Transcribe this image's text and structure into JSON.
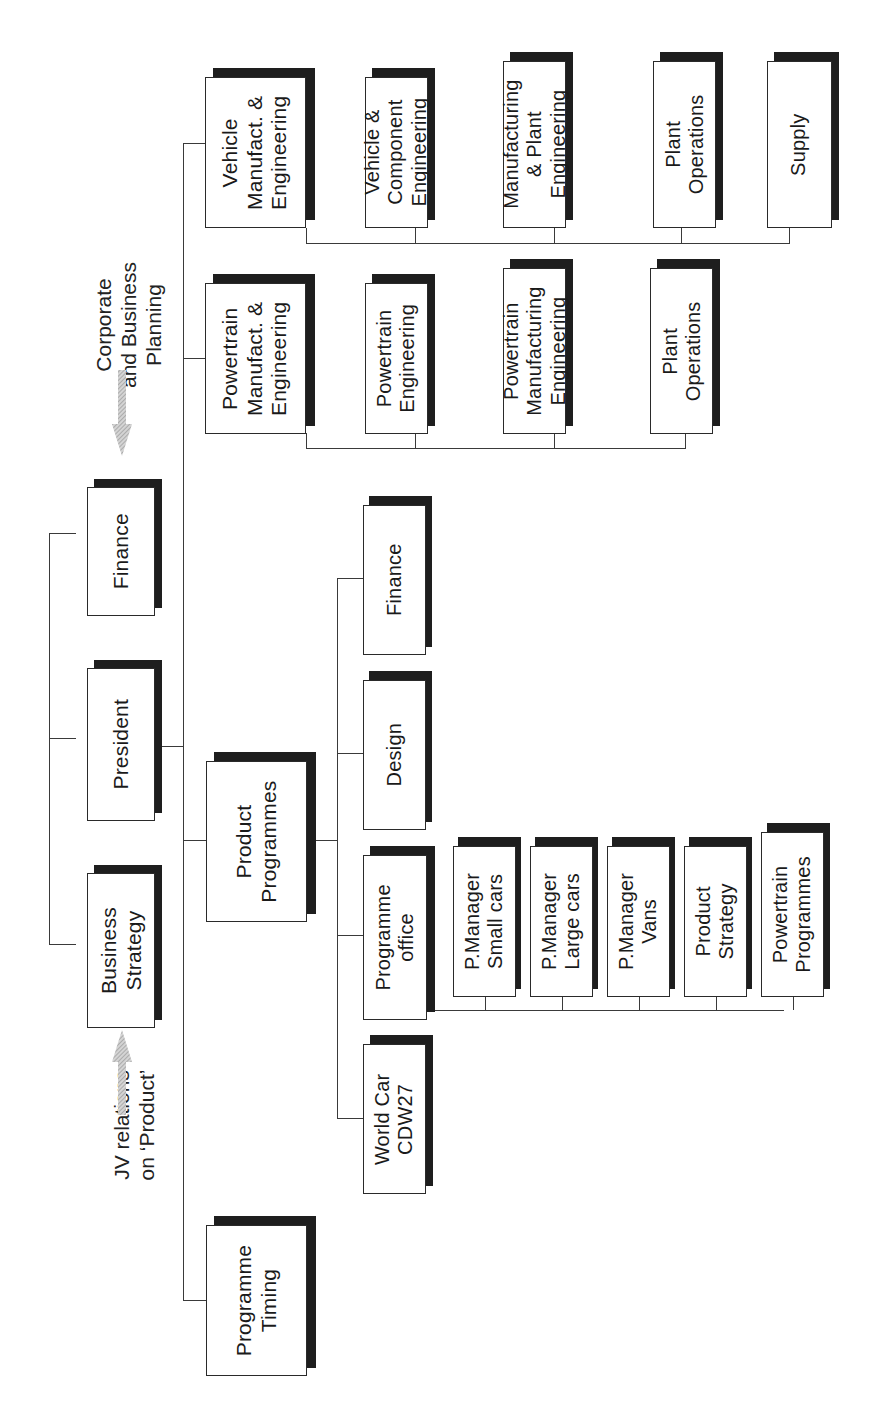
{
  "diagram": {
    "type": "org-chart",
    "orientation": "rotated-90-ccw",
    "colors": {
      "box_border": "#2a2a2a",
      "shadow": "#1e1e1e",
      "line": "#3a3a3a",
      "arrow": "#b8b8b8",
      "background": "#ffffff"
    },
    "annotations": {
      "corporate_planning": {
        "lines": [
          "Corporate",
          "and Business",
          "Planning"
        ]
      },
      "jv_relations": {
        "lines": [
          "JV relations",
          "on ‘Product’"
        ]
      }
    },
    "top_level": {
      "finance": {
        "lines": [
          "Finance"
        ]
      },
      "president": {
        "lines": [
          "President"
        ]
      },
      "business_strategy": {
        "lines": [
          "Business",
          "Strategy"
        ]
      }
    },
    "divisions": {
      "vehicle_manufacturing": {
        "lines": [
          "Vehicle",
          "Manufact. &",
          "Engineering"
        ],
        "children": [
          {
            "lines": [
              "Vehicle &",
              "Component",
              "Engineering"
            ]
          },
          {
            "lines": [
              "Manufacturing",
              "& Plant",
              "Engineering"
            ]
          },
          {
            "lines": [
              "Plant",
              "Operations"
            ]
          },
          {
            "lines": [
              "Supply"
            ]
          }
        ]
      },
      "powertrain_manufacturing": {
        "lines": [
          "Powertrain",
          "Manufact. &",
          "Engineering"
        ],
        "children": [
          {
            "lines": [
              "Powertrain",
              "Engineering"
            ]
          },
          {
            "lines": [
              "Powertrain",
              "Manufacturing",
              "Engineering"
            ]
          },
          {
            "lines": [
              "Plant",
              "Operations"
            ]
          }
        ]
      },
      "product_programmes": {
        "lines": [
          "Product",
          "Programmes"
        ],
        "children": {
          "finance": {
            "lines": [
              "Finance"
            ]
          },
          "design": {
            "lines": [
              "Design"
            ]
          },
          "programme_office": {
            "lines": [
              "Programme",
              "office"
            ],
            "children": [
              {
                "lines": [
                  "P.Manager",
                  "Small cars"
                ]
              },
              {
                "lines": [
                  "P.Manager",
                  "Large cars"
                ]
              },
              {
                "lines": [
                  "P.Manager",
                  "Vans"
                ]
              },
              {
                "lines": [
                  "Product",
                  "Strategy"
                ]
              },
              {
                "lines": [
                  "Powertrain",
                  "Programmes"
                ]
              }
            ]
          },
          "world_car": {
            "lines": [
              "World Car",
              "CDW27"
            ]
          }
        }
      },
      "programme_timing": {
        "lines": [
          "Programme",
          "Timing"
        ]
      }
    }
  }
}
